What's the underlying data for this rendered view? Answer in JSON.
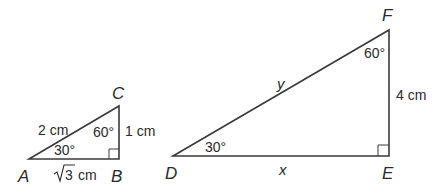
{
  "small_triangle": {
    "vertices": {
      "A": "A",
      "B": "B",
      "C": "C"
    },
    "side_AC": "2 cm",
    "side_BC": "1 cm",
    "side_AB_radical": "3",
    "side_AB_unit": " cm",
    "angle_A": "30°",
    "angle_C": "60°"
  },
  "large_triangle": {
    "vertices": {
      "D": "D",
      "E": "E",
      "F": "F"
    },
    "side_DF": "y",
    "side_DE": "x",
    "side_EF": "4 cm",
    "angle_D": "30°",
    "angle_F": "60°"
  },
  "colors": {
    "stroke": "#3a3a3a",
    "text": "#2a2a2a",
    "background": "#ffffff"
  }
}
